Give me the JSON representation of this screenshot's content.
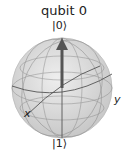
{
  "title": "qubit 0",
  "labels": {
    "top": "|0⟩",
    "bottom": "|1⟩",
    "x": "x",
    "y": "y"
  },
  "vector": {
    "theta_deg": 0,
    "phi_deg": 0,
    "color": "#555555"
  },
  "colors": {
    "sphere": "#d9d9d9",
    "wire": "#7f7f7f",
    "text": "#222222"
  }
}
